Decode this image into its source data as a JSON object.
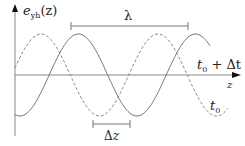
{
  "diagram": {
    "y_axis_label": {
      "main": "e",
      "sub": "yh",
      "arg": "(z)"
    },
    "x_axis_label": "z",
    "wavelength_label": "λ",
    "shift_label": {
      "delta": "Δ",
      "var": "z"
    },
    "curves": [
      {
        "name": "t0-plus-dt",
        "label_main": "t",
        "label_sub": "0",
        "label_rest": " + Δt",
        "style": "solid",
        "phase_shift_fraction": 0.32
      },
      {
        "name": "t0",
        "label_main": "t",
        "label_sub": "0",
        "label_rest": "",
        "style": "dashed",
        "phase_shift_fraction": 0
      }
    ],
    "colors": {
      "line": "#777777",
      "axis": "#888888",
      "text": "#222222"
    }
  }
}
